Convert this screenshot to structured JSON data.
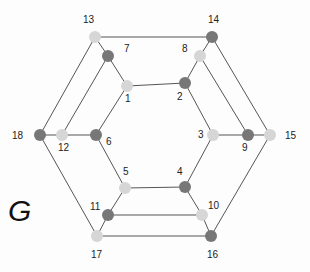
{
  "graph": {
    "title": "G",
    "colors": {
      "dark": "#777777",
      "light": "#d6d6d6",
      "edge": "#555555"
    },
    "nodes": [
      {
        "id": "1",
        "x": 127,
        "y": 86,
        "shade": "light",
        "label_dx": -2,
        "label_dy": 16
      },
      {
        "id": "2",
        "x": 185,
        "y": 83,
        "shade": "dark",
        "label_dx": -8,
        "label_dy": 17
      },
      {
        "id": "3",
        "x": 213,
        "y": 135,
        "shade": "light",
        "label_dx": -15,
        "label_dy": 3
      },
      {
        "id": "4",
        "x": 185,
        "y": 187,
        "shade": "dark",
        "label_dx": -8,
        "label_dy": -12
      },
      {
        "id": "5",
        "x": 125,
        "y": 188,
        "shade": "light",
        "label_dx": -2,
        "label_dy": -13
      },
      {
        "id": "6",
        "x": 96,
        "y": 135,
        "shade": "dark",
        "label_dx": 10,
        "label_dy": 10
      },
      {
        "id": "7",
        "x": 108,
        "y": 56,
        "shade": "dark",
        "label_dx": 16,
        "label_dy": -4
      },
      {
        "id": "8",
        "x": 200,
        "y": 56,
        "shade": "light",
        "label_dx": -18,
        "label_dy": -4
      },
      {
        "id": "9",
        "x": 248,
        "y": 135,
        "shade": "dark",
        "label_dx": -6,
        "label_dy": 16
      },
      {
        "id": "10",
        "x": 202,
        "y": 215,
        "shade": "light",
        "label_dx": 6,
        "label_dy": -6
      },
      {
        "id": "11",
        "x": 108,
        "y": 215,
        "shade": "dark",
        "label_dx": -18,
        "label_dy": -5
      },
      {
        "id": "12",
        "x": 62,
        "y": 135,
        "shade": "light",
        "label_dx": -4,
        "label_dy": 16
      },
      {
        "id": "13",
        "x": 95,
        "y": 37,
        "shade": "light",
        "label_dx": -12,
        "label_dy": -14
      },
      {
        "id": "14",
        "x": 212,
        "y": 37,
        "shade": "dark",
        "label_dx": -4,
        "label_dy": -14
      },
      {
        "id": "15",
        "x": 270,
        "y": 135,
        "shade": "light",
        "label_dx": 15,
        "label_dy": 4
      },
      {
        "id": "16",
        "x": 211,
        "y": 236,
        "shade": "dark",
        "label_dx": -4,
        "label_dy": 22
      },
      {
        "id": "17",
        "x": 97,
        "y": 236,
        "shade": "light",
        "label_dx": -6,
        "label_dy": 22
      },
      {
        "id": "18",
        "x": 40,
        "y": 135,
        "shade": "dark",
        "label_dx": -28,
        "label_dy": 4
      }
    ],
    "edges": [
      [
        "1",
        "2"
      ],
      [
        "2",
        "3"
      ],
      [
        "3",
        "4"
      ],
      [
        "4",
        "5"
      ],
      [
        "5",
        "6"
      ],
      [
        "6",
        "1"
      ],
      [
        "13",
        "14"
      ],
      [
        "14",
        "15"
      ],
      [
        "15",
        "16"
      ],
      [
        "16",
        "17"
      ],
      [
        "17",
        "18"
      ],
      [
        "18",
        "13"
      ],
      [
        "13",
        "7"
      ],
      [
        "7",
        "1"
      ],
      [
        "14",
        "8"
      ],
      [
        "8",
        "2"
      ],
      [
        "3",
        "9"
      ],
      [
        "9",
        "15"
      ],
      [
        "4",
        "10"
      ],
      [
        "10",
        "16"
      ],
      [
        "5",
        "11"
      ],
      [
        "11",
        "17"
      ],
      [
        "6",
        "12"
      ],
      [
        "12",
        "18"
      ],
      [
        "7",
        "12"
      ],
      [
        "8",
        "9"
      ],
      [
        "10",
        "11"
      ]
    ]
  }
}
